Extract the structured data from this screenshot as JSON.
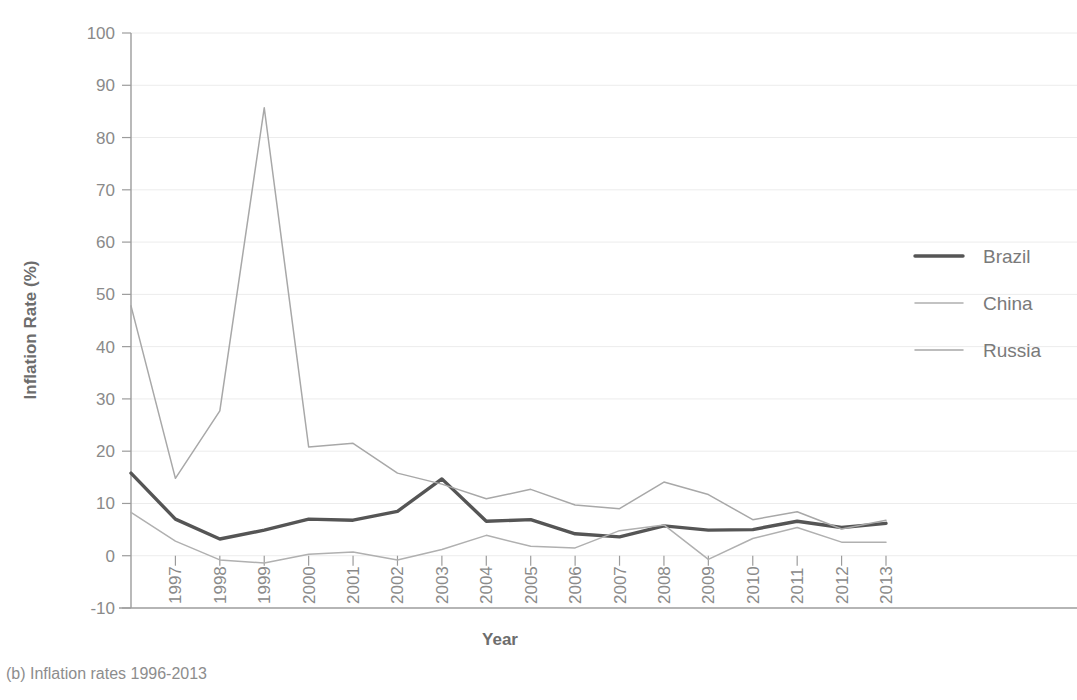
{
  "caption": "(b) Inflation rates 1996-2013",
  "axes": {
    "xlabel": "Year",
    "ylabel": "Inflation Rate (%)",
    "ytick_labels": [
      "-10",
      "0",
      "10",
      "20",
      "30",
      "40",
      "50",
      "60",
      "70",
      "80",
      "90",
      "100"
    ],
    "xtick_labels": [
      "",
      "1997",
      "1998",
      "1999",
      "2000",
      "2001",
      "2002",
      "2003",
      "2004",
      "2005",
      "2006",
      "2007",
      "2008",
      "2009",
      "2010",
      "2011",
      "2012",
      "2013"
    ]
  },
  "legend": {
    "position": "right",
    "items": [
      {
        "label": "Brazil",
        "color": "#555555",
        "width": 3.4
      },
      {
        "label": "China",
        "color": "#b0b0b0",
        "width": 1.5
      },
      {
        "label": "Russia",
        "color": "#a8a8a8",
        "width": 1.5
      }
    ]
  },
  "chart_data": {
    "type": "line",
    "title": "",
    "subtitle": "",
    "xlabel": "Year",
    "ylabel": "Inflation Rate (%)",
    "x": [
      1996,
      1997,
      1998,
      1999,
      2000,
      2001,
      2002,
      2003,
      2004,
      2005,
      2006,
      2007,
      2008,
      2009,
      2010,
      2011,
      2012,
      2013
    ],
    "xlim": [
      1996,
      2013
    ],
    "ylim": [
      -10,
      100
    ],
    "ytick_step": 10,
    "grid": true,
    "legend_position": "right",
    "series": [
      {
        "name": "Brazil",
        "color": "#555555",
        "values": [
          15.8,
          7.0,
          3.2,
          4.9,
          7.0,
          6.8,
          8.5,
          14.7,
          6.6,
          6.9,
          4.2,
          3.6,
          5.7,
          4.9,
          5.0,
          6.6,
          5.4,
          6.2
        ]
      },
      {
        "name": "China",
        "color": "#b0b0b0",
        "values": [
          8.3,
          2.8,
          -0.8,
          -1.4,
          0.3,
          0.7,
          -0.8,
          1.2,
          3.9,
          1.8,
          1.5,
          4.8,
          5.9,
          -0.7,
          3.3,
          5.4,
          2.6,
          2.6
        ]
      },
      {
        "name": "Russia",
        "color": "#a8a8a8",
        "values": [
          47.8,
          14.8,
          27.7,
          85.7,
          20.8,
          21.5,
          15.8,
          13.7,
          10.9,
          12.7,
          9.7,
          9.0,
          14.1,
          11.7,
          6.9,
          8.4,
          5.1,
          6.8
        ]
      }
    ]
  }
}
